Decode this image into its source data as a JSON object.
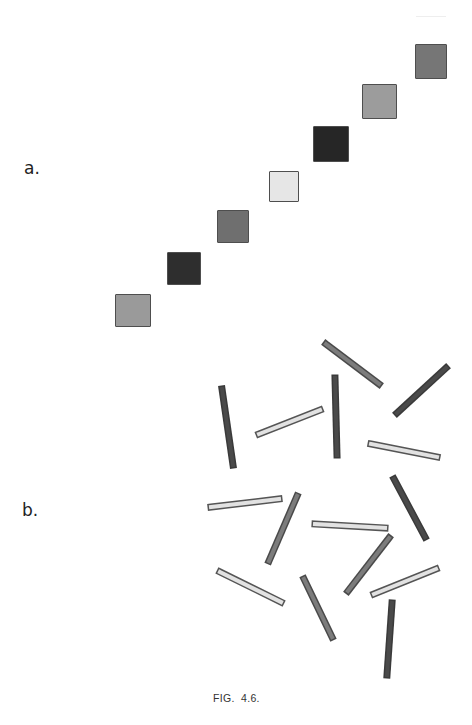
{
  "figure": {
    "caption": "FIG.  4.6.",
    "part_a": {
      "label": "a.",
      "squares": [
        {
          "x": 115,
          "y": 294,
          "w": 36,
          "h": 33,
          "fill": "#9a9a9a"
        },
        {
          "x": 167,
          "y": 252,
          "w": 34,
          "h": 33,
          "fill": "#2e2e2e"
        },
        {
          "x": 217,
          "y": 210,
          "w": 32,
          "h": 33,
          "fill": "#6f6f6f"
        },
        {
          "x": 269,
          "y": 171,
          "w": 30,
          "h": 31,
          "fill": "#e6e6e6"
        },
        {
          "x": 313,
          "y": 126,
          "w": 36,
          "h": 36,
          "fill": "#262626"
        },
        {
          "x": 362,
          "y": 84,
          "w": 35,
          "h": 35,
          "fill": "#9c9c9c"
        },
        {
          "x": 415,
          "y": 44,
          "w": 32,
          "h": 35,
          "fill": "#767676"
        }
      ]
    },
    "part_b": {
      "label": "b.",
      "bar_styles": {
        "light": {
          "fill": "#e2e2e2",
          "stroke": "#555555"
        },
        "mid": {
          "fill": "#7c7c7c",
          "stroke": "#4a4a4a"
        },
        "dark": {
          "fill": "#4a4a4a",
          "stroke": "#3a3a3a"
        }
      },
      "bars": [
        {
          "x1": 326,
          "y1": 344,
          "x2": 379,
          "y2": 384,
          "shade": "mid"
        },
        {
          "x1": 446,
          "y1": 368,
          "x2": 397,
          "y2": 413,
          "shade": "dark"
        },
        {
          "x1": 222,
          "y1": 389,
          "x2": 233,
          "y2": 465,
          "shade": "dark"
        },
        {
          "x1": 259,
          "y1": 434,
          "x2": 320,
          "y2": 410,
          "shade": "light"
        },
        {
          "x1": 335,
          "y1": 378,
          "x2": 337,
          "y2": 455,
          "shade": "dark"
        },
        {
          "x1": 371,
          "y1": 444,
          "x2": 437,
          "y2": 457,
          "shade": "light"
        },
        {
          "x1": 211,
          "y1": 507,
          "x2": 279,
          "y2": 499,
          "shade": "light"
        },
        {
          "x1": 297,
          "y1": 496,
          "x2": 269,
          "y2": 561,
          "shade": "mid"
        },
        {
          "x1": 315,
          "y1": 524,
          "x2": 385,
          "y2": 528,
          "shade": "light"
        },
        {
          "x1": 394,
          "y1": 479,
          "x2": 425,
          "y2": 537,
          "shade": "dark"
        },
        {
          "x1": 389,
          "y1": 538,
          "x2": 348,
          "y2": 591,
          "shade": "mid"
        },
        {
          "x1": 220,
          "y1": 572,
          "x2": 281,
          "y2": 602,
          "shade": "light"
        },
        {
          "x1": 436,
          "y1": 569,
          "x2": 374,
          "y2": 594,
          "shade": "light"
        },
        {
          "x1": 304,
          "y1": 579,
          "x2": 332,
          "y2": 637,
          "shade": "mid"
        },
        {
          "x1": 392,
          "y1": 603,
          "x2": 387,
          "y2": 675,
          "shade": "dark"
        }
      ]
    }
  }
}
